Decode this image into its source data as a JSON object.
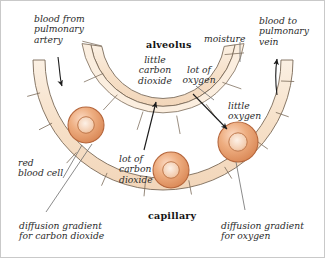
{
  "diagram": {
    "type": "biology-cross-section",
    "colors": {
      "wall_fill": "#f7e2cd",
      "wall_fill_light": "#fbeedf",
      "wall_stroke": "#7a6a58",
      "cell_outer": "#e8a678",
      "cell_mid": "#f0c0a0",
      "cell_stroke": "#b5663c",
      "leader_line": "#6d6d6d",
      "arrow": "#1c1c1c",
      "text": "#2b2b2b",
      "frame": "#c9c9c9"
    },
    "structures": [
      {
        "name": "alveolus",
        "label": "alveolus",
        "emphasis": "bold"
      },
      {
        "name": "capillary",
        "label": "capillary",
        "emphasis": "bold"
      }
    ],
    "labels": [
      {
        "id": "blood-from-pulmonary-artery",
        "text": "blood from\npulmonary\nartery",
        "align": "left"
      },
      {
        "id": "alveolus",
        "text": "alveolus",
        "align": "center",
        "bold": true
      },
      {
        "id": "moisture",
        "text": "moisture",
        "align": "center"
      },
      {
        "id": "blood-to-pulmonary-vein",
        "text": "blood to\npulmonary\nvein",
        "align": "left"
      },
      {
        "id": "little-carbon-dioxide",
        "text": "little\ncarbon\ndioxide",
        "align": "center"
      },
      {
        "id": "lot-of-oxygen",
        "text": "lot of\noxygen",
        "align": "center"
      },
      {
        "id": "little-oxygen",
        "text": "little\noxygen",
        "align": "left"
      },
      {
        "id": "red-blood-cell",
        "text": "red\nblood cell",
        "align": "left"
      },
      {
        "id": "lot-of-carbon-dioxide",
        "text": "lot of\ncarbon\ndioxide",
        "align": "left"
      },
      {
        "id": "capillary",
        "text": "capillary",
        "align": "center",
        "bold": true
      },
      {
        "id": "diffusion-gradient-for-carbon-dioxide",
        "text": "diffusion gradient\nfor carbon dioxide",
        "align": "left"
      },
      {
        "id": "diffusion-gradient-for-oxygen",
        "text": "diffusion gradient\nfor oxygen",
        "align": "left"
      }
    ],
    "red_blood_cells": [
      {
        "id": "rbc-left",
        "cx": 86,
        "cy": 125,
        "r": 18
      },
      {
        "id": "rbc-center",
        "cx": 171,
        "cy": 170,
        "r": 18
      },
      {
        "id": "rbc-right",
        "cx": 238,
        "cy": 142,
        "r": 20
      }
    ],
    "arrows": [
      {
        "id": "arrow-blood-in",
        "direction": "down",
        "meaning": "blood flow into capillary"
      },
      {
        "id": "arrow-blood-out",
        "direction": "up",
        "meaning": "blood flow out of capillary"
      },
      {
        "id": "arrow-co2-diffusion",
        "direction": "up",
        "meaning": "carbon dioxide diffuses into alveolus"
      },
      {
        "id": "arrow-o2-diffusion",
        "direction": "down-right",
        "meaning": "oxygen diffuses into blood"
      }
    ]
  },
  "text": {
    "blood_from_artery_l1": "blood from",
    "blood_from_artery_l2": "pulmonary",
    "blood_from_artery_l3": "artery",
    "alveolus": "alveolus",
    "moisture": "moisture",
    "blood_to_vein_l1": "blood to",
    "blood_to_vein_l2": "pulmonary",
    "blood_to_vein_l3": "vein",
    "little_co2_l1": "little",
    "little_co2_l2": "carbon",
    "little_co2_l3": "dioxide",
    "lot_o2_l1": "lot of",
    "lot_o2_l2": "oxygen",
    "little_o2_l1": "little",
    "little_o2_l2": "oxygen",
    "red_blood_cell_l1": "red",
    "red_blood_cell_l2": "blood cell",
    "lot_co2_l1": "lot of",
    "lot_co2_l2": "carbon",
    "lot_co2_l3": "dioxide",
    "capillary": "capillary",
    "diff_co2_l1": "diffusion gradient",
    "diff_co2_l2": "for carbon dioxide",
    "diff_o2_l1": "diffusion gradient",
    "diff_o2_l2": "for oxygen"
  }
}
